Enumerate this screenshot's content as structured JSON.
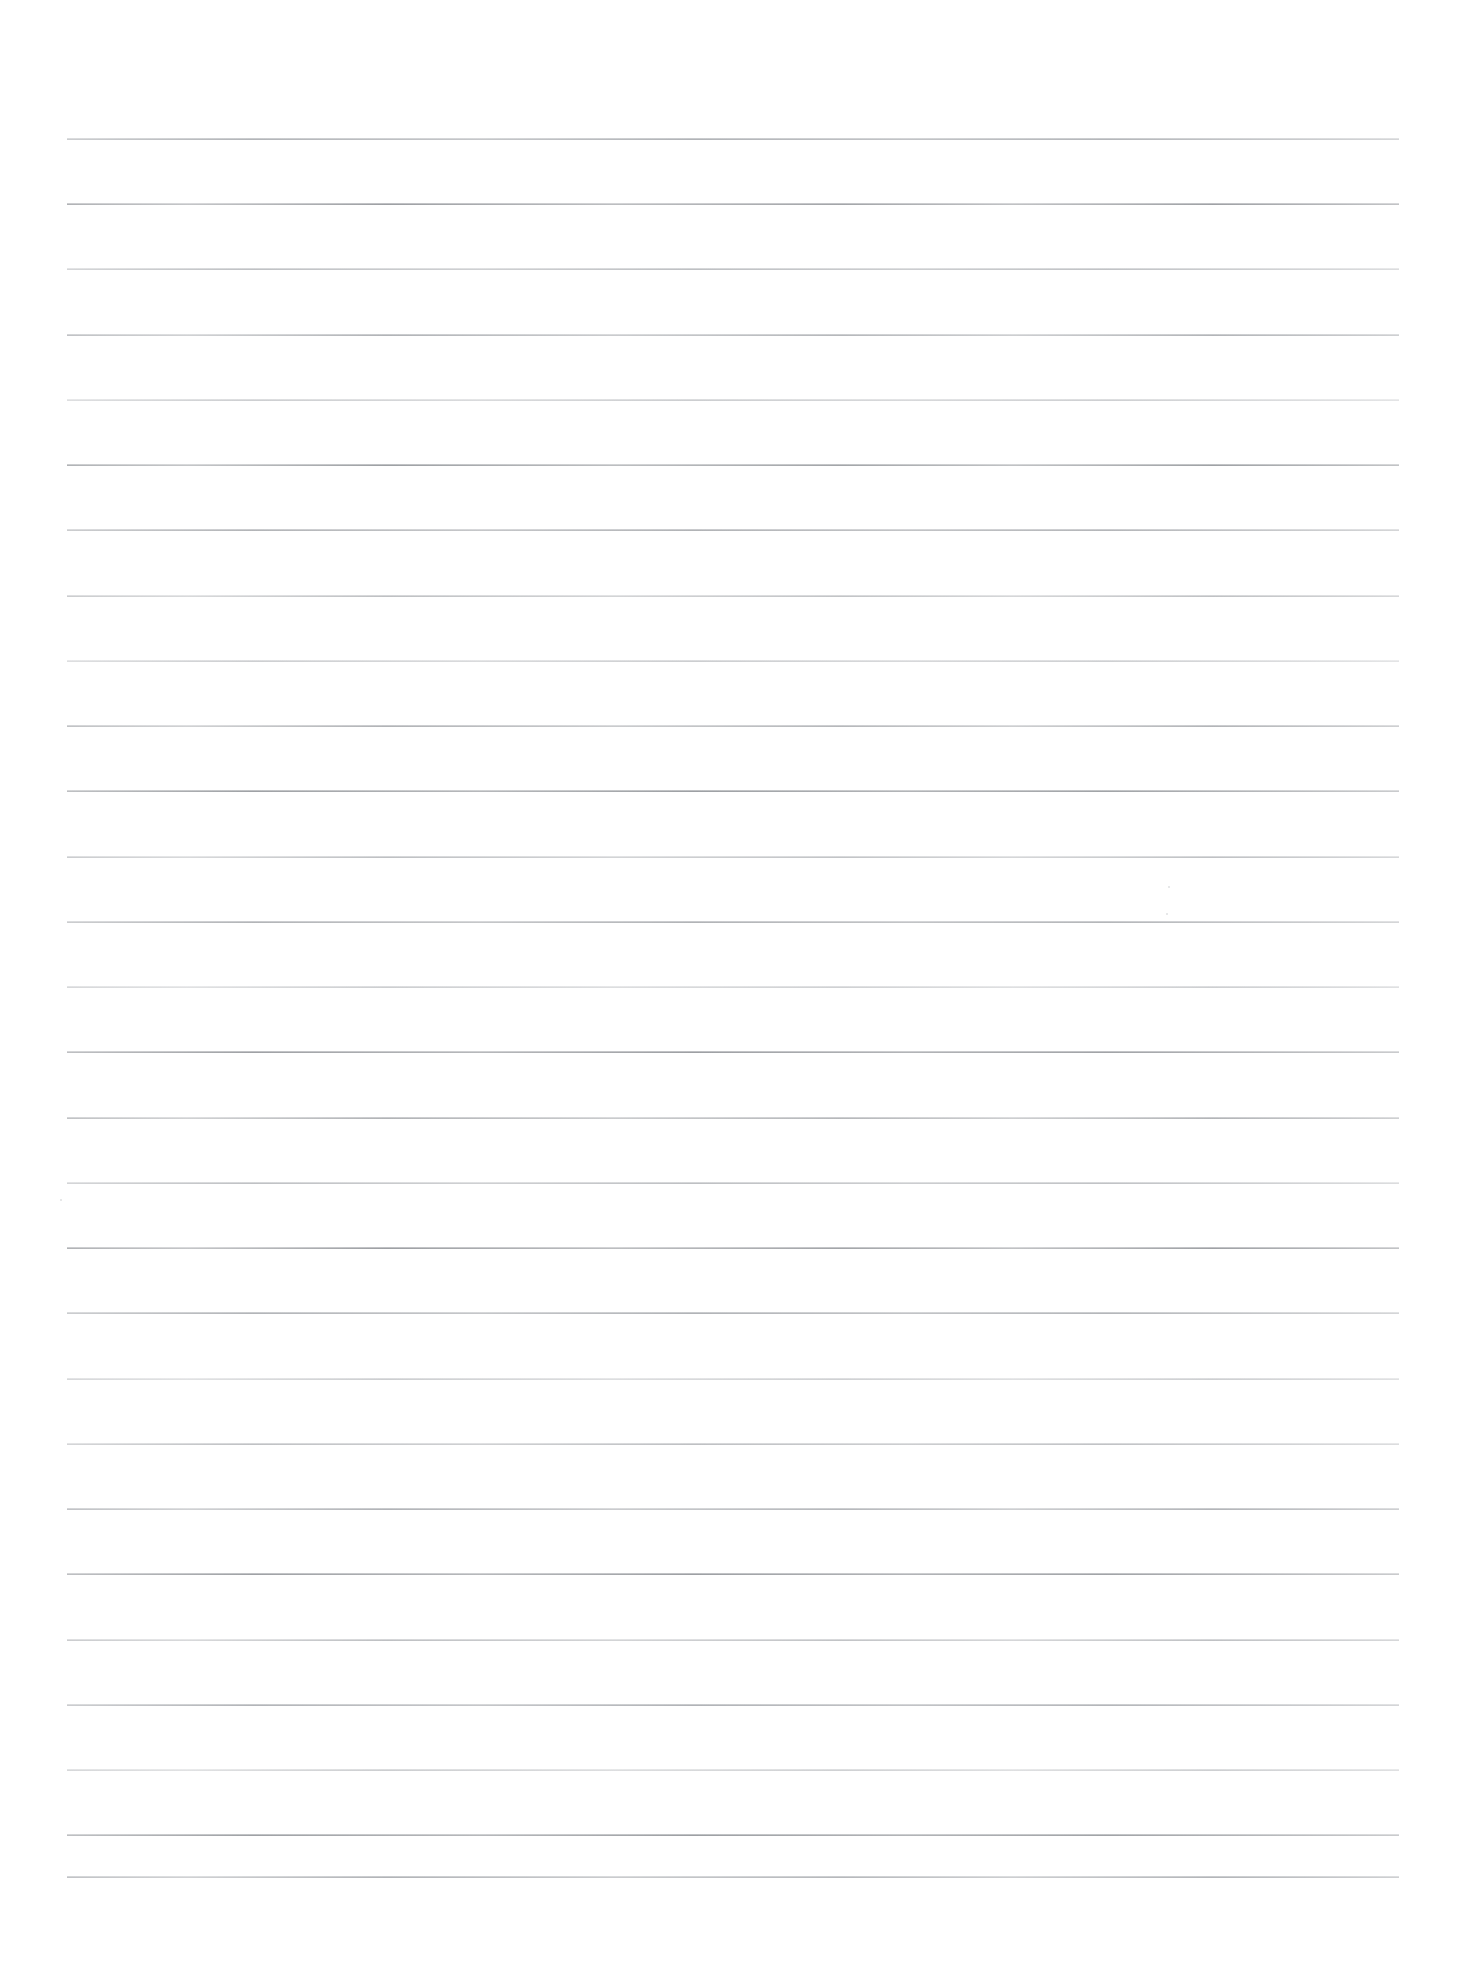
{
  "document": {
    "kind": "scanned-ruled-paper",
    "title": "Blank ruled notebook page (scan)",
    "page_width": 1464,
    "page_height": 1969,
    "background_color": "#ffffff",
    "rule_color": "#84888e",
    "text_content": "",
    "visible_text": []
  },
  "ruling": {
    "line_count": 27,
    "first_line_y": 138,
    "line_spacing": 65.2,
    "line_left_x": 67,
    "line_right_x": 1399,
    "line_width": 1332,
    "line_thickness": 2,
    "margins": {
      "left": 67,
      "right": 65,
      "top": 138,
      "bottom": 93
    },
    "lines": [
      {
        "index": 1,
        "y": 138,
        "style": "k0",
        "alt": false
      },
      {
        "index": 2,
        "y": 203,
        "style": "k2",
        "alt": true
      },
      {
        "index": 3,
        "y": 268,
        "style": "k1",
        "alt": false
      },
      {
        "index": 4,
        "y": 334,
        "style": "k0",
        "alt": true
      },
      {
        "index": 5,
        "y": 399,
        "style": "k3",
        "alt": false
      },
      {
        "index": 6,
        "y": 464,
        "style": "k2",
        "alt": true
      },
      {
        "index": 7,
        "y": 529,
        "style": "k0",
        "alt": false
      },
      {
        "index": 8,
        "y": 595,
        "style": "k1",
        "alt": true
      },
      {
        "index": 9,
        "y": 660,
        "style": "k3",
        "alt": false
      },
      {
        "index": 10,
        "y": 725,
        "style": "k0",
        "alt": true
      },
      {
        "index": 11,
        "y": 790,
        "style": "k2",
        "alt": false
      },
      {
        "index": 12,
        "y": 856,
        "style": "k1",
        "alt": true
      },
      {
        "index": 13,
        "y": 921,
        "style": "k0",
        "alt": false
      },
      {
        "index": 14,
        "y": 986,
        "style": "k3",
        "alt": true
      },
      {
        "index": 15,
        "y": 1051,
        "style": "k2",
        "alt": false
      },
      {
        "index": 16,
        "y": 1117,
        "style": "k0",
        "alt": true
      },
      {
        "index": 17,
        "y": 1182,
        "style": "k1",
        "alt": false
      },
      {
        "index": 18,
        "y": 1247,
        "style": "k2",
        "alt": true
      },
      {
        "index": 19,
        "y": 1312,
        "style": "k0",
        "alt": false
      },
      {
        "index": 20,
        "y": 1378,
        "style": "k3",
        "alt": true
      },
      {
        "index": 21,
        "y": 1443,
        "style": "k1",
        "alt": false
      },
      {
        "index": 22,
        "y": 1508,
        "style": "k0",
        "alt": true
      },
      {
        "index": 23,
        "y": 1573,
        "style": "k2",
        "alt": false
      },
      {
        "index": 24,
        "y": 1639,
        "style": "k1",
        "alt": true
      },
      {
        "index": 25,
        "y": 1704,
        "style": "k0",
        "alt": false
      },
      {
        "index": 26,
        "y": 1769,
        "style": "k3",
        "alt": true
      },
      {
        "index": 27,
        "y": 1834,
        "style": "k2",
        "alt": false
      },
      {
        "index": 28,
        "y": 1876,
        "style": "k0",
        "alt": true
      }
    ]
  },
  "artifacts": {
    "specks": [
      {
        "x": 1168,
        "y": 886,
        "size": 2
      },
      {
        "x": 1166,
        "y": 913,
        "size": 2
      },
      {
        "x": 60,
        "y": 1199,
        "size": 2
      }
    ]
  }
}
